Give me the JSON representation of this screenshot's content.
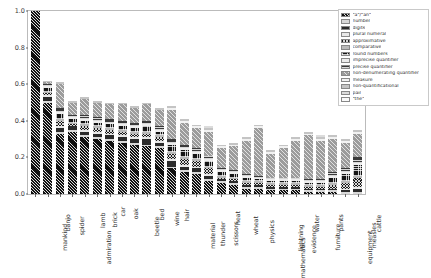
{
  "chart_data": {
    "type": "bar",
    "subtype": "stacked-bar-normalized",
    "title": "",
    "xlabel": "",
    "ylabel": "",
    "ylim": [
      0.0,
      1.0
    ],
    "yticks": [
      "0.0",
      "0.2",
      "0.4",
      "0.6",
      "0.8",
      "1.0"
    ],
    "ytick_values": [
      0.0,
      0.2,
      0.4,
      0.6,
      0.8,
      1.0
    ],
    "grid": false,
    "legend_position": "upper right (outside axes)",
    "categories": [
      "mankind",
      "banjo",
      "spider",
      "admiration",
      "lamb",
      "brick",
      "car",
      "oak",
      "beetle",
      "bed",
      "wine",
      "hair",
      "material",
      "thunder",
      "scissors",
      "heat",
      "wheat",
      "physics",
      "mathematics",
      "lightning",
      "evidence",
      "water",
      "furniture",
      "pants",
      "equipment",
      "measles",
      "cattle"
    ],
    "series": [
      {
        "name": "\"a\"/\"an\"",
        "color": "#111111",
        "hatch": "diagonal-dense",
        "values": [
          1.0,
          0.5,
          0.33,
          0.34,
          0.31,
          0.3,
          0.29,
          0.28,
          0.27,
          0.26,
          0.25,
          0.14,
          0.12,
          0.11,
          0.07,
          0.06,
          0.05,
          0.03,
          0.03,
          0.02,
          0.02,
          0.02,
          0.01,
          0.01,
          0.01,
          0.0,
          0.0
        ]
      },
      {
        "name": "number",
        "color": "#d8d8d8",
        "hatch": "none",
        "values": [
          0.0,
          0.01,
          0.01,
          0.01,
          0.01,
          0.01,
          0.01,
          0.01,
          0.01,
          0.01,
          0.01,
          0.01,
          0.01,
          0.01,
          0.01,
          0.01,
          0.01,
          0.01,
          0.01,
          0.01,
          0.01,
          0.01,
          0.01,
          0.01,
          0.01,
          0.01,
          0.01
        ]
      },
      {
        "name": "digits",
        "color": "#2b2b2b",
        "hatch": "none",
        "values": [
          0.0,
          0.02,
          0.02,
          0.02,
          0.02,
          0.02,
          0.02,
          0.02,
          0.02,
          0.03,
          0.02,
          0.03,
          0.02,
          0.02,
          0.02,
          0.01,
          0.01,
          0.01,
          0.01,
          0.01,
          0.01,
          0.01,
          0.01,
          0.01,
          0.01,
          0.01,
          0.02
        ]
      },
      {
        "name": "plural numeral",
        "color": "#e8e8e8",
        "hatch": "none",
        "values": [
          0.0,
          0.01,
          0.01,
          0.0,
          0.01,
          0.01,
          0.01,
          0.01,
          0.01,
          0.01,
          0.01,
          0.01,
          0.01,
          0.01,
          0.01,
          0.0,
          0.0,
          0.0,
          0.0,
          0.0,
          0.0,
          0.0,
          0.0,
          0.0,
          0.0,
          0.01,
          0.01
        ]
      },
      {
        "name": "approximative",
        "color": "#1c1c1c",
        "hatch": "crosshatch",
        "values": [
          0.0,
          0.01,
          0.03,
          0.01,
          0.02,
          0.02,
          0.02,
          0.02,
          0.02,
          0.02,
          0.02,
          0.03,
          0.03,
          0.03,
          0.03,
          0.01,
          0.01,
          0.01,
          0.01,
          0.01,
          0.01,
          0.01,
          0.01,
          0.01,
          0.02,
          0.03,
          0.05
        ]
      },
      {
        "name": "comparative",
        "color": "#b9b9b9",
        "hatch": "none",
        "values": [
          0.0,
          0.01,
          0.01,
          0.01,
          0.01,
          0.01,
          0.01,
          0.01,
          0.01,
          0.01,
          0.01,
          0.01,
          0.01,
          0.01,
          0.01,
          0.01,
          0.01,
          0.01,
          0.01,
          0.01,
          0.01,
          0.01,
          0.01,
          0.01,
          0.01,
          0.01,
          0.01
        ]
      },
      {
        "name": "round numbers",
        "color": "#151515",
        "hatch": "dots",
        "values": [
          0.0,
          0.02,
          0.03,
          0.02,
          0.02,
          0.02,
          0.02,
          0.02,
          0.02,
          0.03,
          0.02,
          0.04,
          0.04,
          0.03,
          0.03,
          0.02,
          0.02,
          0.02,
          0.01,
          0.01,
          0.01,
          0.01,
          0.01,
          0.01,
          0.03,
          0.04,
          0.06
        ]
      },
      {
        "name": "imprecise quantifier",
        "color": "#ededed",
        "hatch": "none",
        "values": [
          0.0,
          0.01,
          0.01,
          0.01,
          0.01,
          0.01,
          0.01,
          0.01,
          0.01,
          0.01,
          0.01,
          0.01,
          0.01,
          0.01,
          0.01,
          0.01,
          0.01,
          0.01,
          0.01,
          0.01,
          0.01,
          0.01,
          0.01,
          0.01,
          0.01,
          0.01,
          0.01
        ]
      },
      {
        "name": "precise quantifier",
        "color": "#3a3a3a",
        "hatch": "horizontal",
        "values": [
          0.0,
          0.01,
          0.02,
          0.01,
          0.02,
          0.02,
          0.02,
          0.02,
          0.02,
          0.02,
          0.02,
          0.02,
          0.02,
          0.02,
          0.02,
          0.01,
          0.01,
          0.01,
          0.01,
          0.01,
          0.01,
          0.01,
          0.01,
          0.01,
          0.02,
          0.02,
          0.03
        ]
      },
      {
        "name": "non-denumerating quantifier",
        "color": "#9c9c9c",
        "hatch": "diagonal-sparse",
        "values": [
          0.0,
          0.01,
          0.13,
          0.07,
          0.09,
          0.08,
          0.08,
          0.09,
          0.08,
          0.09,
          0.09,
          0.16,
          0.12,
          0.11,
          0.13,
          0.11,
          0.13,
          0.18,
          0.26,
          0.13,
          0.16,
          0.2,
          0.24,
          0.21,
          0.18,
          0.14,
          0.13
        ]
      },
      {
        "name": "measure",
        "color": "#f2f2f2",
        "hatch": "none",
        "values": [
          0.0,
          0.0,
          0.0,
          0.0,
          0.0,
          0.0,
          0.0,
          0.0,
          0.0,
          0.0,
          0.0,
          0.01,
          0.01,
          0.01,
          0.01,
          0.01,
          0.01,
          0.01,
          0.01,
          0.01,
          0.01,
          0.01,
          0.01,
          0.01,
          0.01,
          0.01,
          0.01
        ]
      },
      {
        "name": "non-quantificational",
        "color": "#c4c4c4",
        "hatch": "none",
        "values": [
          0.0,
          0.01,
          0.01,
          0.01,
          0.01,
          0.01,
          0.01,
          0.01,
          0.01,
          0.01,
          0.01,
          0.01,
          0.01,
          0.01,
          0.01,
          0.01,
          0.01,
          0.01,
          0.01,
          0.01,
          0.01,
          0.01,
          0.01,
          0.01,
          0.01,
          0.01,
          0.01
        ]
      },
      {
        "name": "pair",
        "color": "#dcdcdc",
        "hatch": "none",
        "values": [
          0.0,
          0.0,
          0.0,
          0.0,
          0.0,
          0.0,
          0.0,
          0.0,
          0.0,
          0.0,
          0.0,
          0.0,
          0.0,
          0.0,
          0.01,
          0.0,
          0.0,
          0.0,
          0.0,
          0.0,
          0.0,
          0.0,
          0.0,
          0.01,
          0.0,
          0.0,
          0.0
        ]
      },
      {
        "name": "\"the\"",
        "color": "#fafafa",
        "hatch": "none",
        "values": [
          0.0,
          0.0,
          0.0,
          0.0,
          0.0,
          0.0,
          0.0,
          0.0,
          0.0,
          0.0,
          0.0,
          0.0,
          0.0,
          0.0,
          0.0,
          0.0,
          0.0,
          0.0,
          0.0,
          0.0,
          0.0,
          0.0,
          0.0,
          0.0,
          0.0,
          0.0,
          0.0
        ]
      }
    ],
    "bar_totals": [
      1.0,
      0.62,
      0.61,
      0.51,
      0.53,
      0.51,
      0.5,
      0.5,
      0.48,
      0.5,
      0.47,
      0.48,
      0.41,
      0.38,
      0.36,
      0.26,
      0.27,
      0.3,
      0.38,
      0.23,
      0.25,
      0.29,
      0.32,
      0.3,
      0.31,
      0.29,
      0.34
    ]
  }
}
